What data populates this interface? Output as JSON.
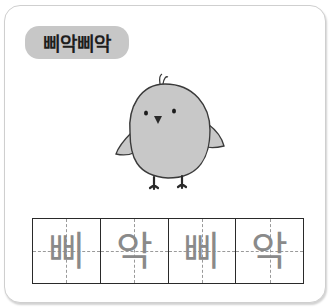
{
  "title_label": "삐악삐악",
  "illustration": {
    "subject": "chick-icon",
    "body_color": "#c8c8c8",
    "outline_color": "#3a3a3a"
  },
  "writing_grid": {
    "cells": [
      {
        "char": "삐"
      },
      {
        "char": "악"
      },
      {
        "char": "삐"
      },
      {
        "char": "악"
      }
    ],
    "char_color": "#8a8a8a",
    "border_color": "#2a2a2a"
  },
  "colors": {
    "pill_bg": "#c7c7c7",
    "card_border": "#cfcfcf"
  }
}
